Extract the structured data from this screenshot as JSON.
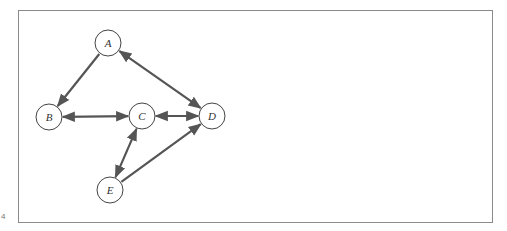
{
  "diagram": {
    "type": "directed-graph",
    "colors": {
      "edge": "#555555",
      "node_stroke": "#444444",
      "frame": "#8a8a8a"
    },
    "corner_mark": "4",
    "nodes": [
      {
        "id": "A",
        "label": "A",
        "x": 108,
        "y": 43
      },
      {
        "id": "B",
        "label": "B",
        "x": 49,
        "y": 117
      },
      {
        "id": "C",
        "label": "C",
        "x": 142,
        "y": 116
      },
      {
        "id": "D",
        "label": "D",
        "x": 212,
        "y": 116
      },
      {
        "id": "E",
        "label": "E",
        "x": 110,
        "y": 190
      }
    ],
    "edges": [
      {
        "from": "A",
        "to": "B",
        "direction": "forward"
      },
      {
        "from": "A",
        "to": "D",
        "direction": "both"
      },
      {
        "from": "B",
        "to": "C",
        "direction": "both"
      },
      {
        "from": "C",
        "to": "D",
        "direction": "both"
      },
      {
        "from": "C",
        "to": "E",
        "direction": "both"
      },
      {
        "from": "E",
        "to": "D",
        "direction": "forward"
      }
    ]
  }
}
